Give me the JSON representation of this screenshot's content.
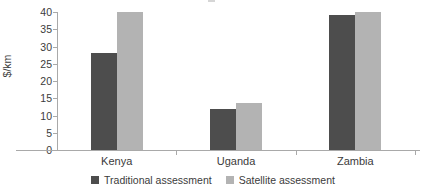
{
  "chart_data": {
    "type": "bar",
    "title": "",
    "subtitle": "",
    "xlabel": "",
    "ylabel": "$/km",
    "categories": [
      "Kenya",
      "Uganda",
      "Zambia"
    ],
    "series": [
      {
        "name": "Traditional assessment",
        "color": "#4d4d4d",
        "values": [
          28,
          12,
          39
        ]
      },
      {
        "name": "Satellite assessment",
        "color": "#b3b3b3",
        "values": [
          40,
          13.5,
          40
        ]
      }
    ],
    "ylim": [
      0,
      40
    ],
    "yticks": [
      0,
      5,
      10,
      15,
      20,
      25,
      30,
      35,
      40
    ],
    "ytick_labels": [
      "0",
      "5",
      "10",
      "15",
      "20",
      "25",
      "30",
      "35",
      "40"
    ],
    "grid": false,
    "legend_position": "bottom-center",
    "axis_color": "#a9a9a9",
    "text_color": "#3b3b3b",
    "background": "#ffffff"
  }
}
